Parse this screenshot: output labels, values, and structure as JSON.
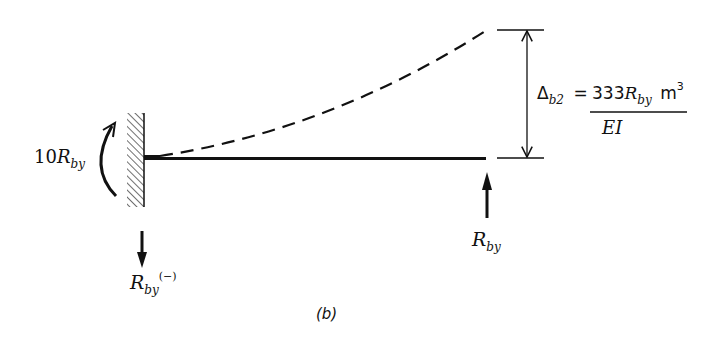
{
  "figure": {
    "caption": "(b)",
    "moment_label": {
      "coef": "10",
      "symbol": "R",
      "sub": "by"
    },
    "left_reaction_label": {
      "symbol": "R",
      "sub": "by",
      "sup": "(−)"
    },
    "right_reaction_label": {
      "symbol": "R",
      "sub": "by"
    },
    "deflection": {
      "lhs_symbol": "Δ",
      "lhs_sub": "b2",
      "equals": "=",
      "numerator_coef": "333",
      "numerator_symbol": "R",
      "numerator_sub": "by",
      "numerator_unit": "m",
      "numerator_unit_exp": "3",
      "denominator": "EI"
    }
  },
  "colors": {
    "ink": "#111111",
    "background": "#ffffff"
  }
}
